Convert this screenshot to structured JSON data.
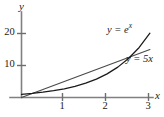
{
  "chart_data": {
    "type": "line",
    "title": "",
    "xlabel": "x",
    "ylabel": "y",
    "xlim": [
      0,
      3.15
    ],
    "ylim": [
      0,
      22
    ],
    "grid": false,
    "legend_position": "inline-annotations",
    "xticks": [
      1,
      2,
      3
    ],
    "xtick_labels": [
      "1",
      "2",
      "3"
    ],
    "yticks": [
      10,
      20
    ],
    "ytick_labels": [
      "10",
      "20"
    ],
    "series": [
      {
        "name": "y = e^x",
        "label_text": "y = e",
        "label_exponent": "x",
        "equation": "y = e^x",
        "color": "#1a1a1a",
        "x": [
          0,
          0.25,
          0.5,
          0.75,
          1,
          1.25,
          1.5,
          1.75,
          2,
          2.25,
          2.5,
          2.75,
          3
        ],
        "values": [
          1,
          1.28,
          1.65,
          2.12,
          2.72,
          3.49,
          4.48,
          5.75,
          7.39,
          9.49,
          12.18,
          15.64,
          20.09
        ]
      },
      {
        "name": "y = 5x",
        "label_text": "y = 5",
        "label_exponent": "x",
        "equation": "y = 5x",
        "color": "#4a4a4a",
        "x": [
          0,
          0.5,
          1,
          1.5,
          2,
          2.5,
          3
        ],
        "values": [
          0,
          2.5,
          5,
          7.5,
          10,
          12.5,
          15
        ]
      }
    ],
    "annotations": [
      {
        "text": "y = e^x",
        "at_x": 2.9,
        "at_y": 21.5
      },
      {
        "text": "y = 5x",
        "at_y": 13.8,
        "at_x": 3.0
      }
    ],
    "intersection_note": "curves cross near x = 2.4"
  },
  "axes": {
    "y_label": "y",
    "x_label": "x"
  },
  "ticks": {
    "y": [
      {
        "label": "20"
      },
      {
        "label": "10"
      }
    ],
    "x": [
      {
        "label": "1"
      },
      {
        "label": "2"
      },
      {
        "label": "3"
      }
    ]
  },
  "curve_labels": {
    "exp_base": "y = e",
    "exp_sup": "x",
    "lin_base": "y = 5",
    "lin_sup": "x"
  },
  "colors": {
    "axis": "#808080",
    "exp_curve": "#1a1a1a",
    "lin_curve": "#4a4a4a",
    "text": "#1a1a1a",
    "background": "#ffffff"
  }
}
